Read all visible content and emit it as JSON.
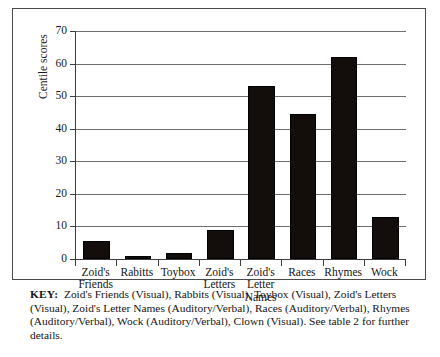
{
  "chart_data": {
    "type": "bar",
    "title": "",
    "xlabel": "",
    "ylabel": "Centile scores",
    "ylim": [
      0,
      70
    ],
    "yticks": [
      0,
      10,
      20,
      30,
      40,
      50,
      60,
      70
    ],
    "grid": true,
    "legend_position": "below-as-key",
    "categories": [
      "Zoid's Friends",
      "Rabitts",
      "Toybox",
      "Zoid's Letters",
      "Zoid's Letter Names",
      "Races",
      "Rhymes",
      "Wock"
    ],
    "category_lines": [
      [
        "Zoid's",
        "Friends"
      ],
      [
        "Rabitts"
      ],
      [
        "Toybox"
      ],
      [
        "Zoid's",
        "Letters"
      ],
      [
        "Zoid's",
        "Letter",
        "Names"
      ],
      [
        "Races"
      ],
      [
        "Rhymes"
      ],
      [
        "Wock"
      ]
    ],
    "values": [
      5.5,
      1,
      1.8,
      9,
      53,
      44.5,
      62,
      13
    ],
    "bar_color": "#130d0b"
  },
  "axis": {
    "y_title": "Centile scores",
    "tick_labels": [
      "0",
      "10",
      "20",
      "30",
      "40",
      "50",
      "60",
      "70"
    ]
  },
  "key": {
    "label": "KEY:",
    "text": "Zoid's Friends (Visual), Rabbits (Visual), Toybox (Visual), Zoid's Letters (Visual), Zoid's Letter Names (Auditory/Verbal), Races (Auditory/Verbal), Rhymes (Auditory/Verbal), Wock (Auditory/Verbal), Clown (Visual). See table 2 for further details."
  }
}
